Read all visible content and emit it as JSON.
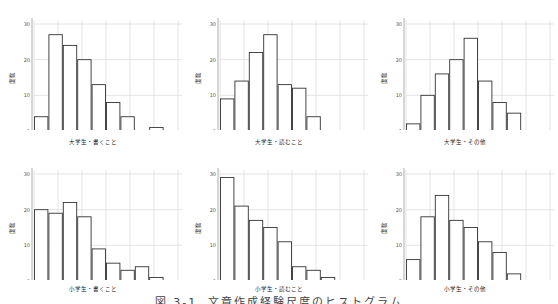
{
  "caption": "図 3-1. 文章作成経験尺度のヒストグラム",
  "chart_data": [
    {
      "type": "bar",
      "title": "",
      "xlabel": "大学生・書くこと",
      "ylabel": "度数",
      "ylim": [
        0,
        30
      ],
      "xlim": [
        1.0,
        4.0
      ],
      "xticks": [
        "1.0",
        "1.5",
        "2.0",
        "2.5",
        "3.0",
        "3.5",
        "4.0"
      ],
      "yticks": [
        "0",
        "10",
        "20",
        "30"
      ],
      "grid": true,
      "bin_width": 0.3,
      "bin_start": 1.0,
      "values": [
        4,
        27,
        24,
        20,
        13,
        8,
        4,
        0,
        1
      ]
    },
    {
      "type": "bar",
      "title": "",
      "xlabel": "大学生・読むこと",
      "ylabel": "度数",
      "ylim": [
        0,
        30
      ],
      "xlim": [
        1.0,
        4.0
      ],
      "xticks": [
        "1.0",
        "1.5",
        "2.0",
        "2.5",
        "3.0",
        "3.5",
        "4.0"
      ],
      "yticks": [
        "0",
        "10",
        "20",
        "30"
      ],
      "grid": true,
      "bin_width": 0.3,
      "bin_start": 1.0,
      "values": [
        9,
        14,
        22,
        27,
        13,
        12,
        4
      ]
    },
    {
      "type": "bar",
      "title": "",
      "xlabel": "大学生・その他",
      "ylabel": "度数",
      "ylim": [
        0,
        30
      ],
      "xlim": [
        1.0,
        4.0
      ],
      "xticks": [
        "1.0",
        "1.5",
        "2.0",
        "2.5",
        "3.0",
        "3.5",
        "4.0"
      ],
      "yticks": [
        "0",
        "10",
        "20",
        "30"
      ],
      "grid": true,
      "bin_width": 0.3,
      "bin_start": 1.0,
      "values": [
        2,
        10,
        16,
        20,
        26,
        14,
        8,
        5
      ]
    },
    {
      "type": "bar",
      "title": "",
      "xlabel": "小学生・書くこと",
      "ylabel": "度数",
      "ylim": [
        0,
        30
      ],
      "xlim": [
        1.0,
        4.0
      ],
      "xticks": [
        "1.0",
        "1.5",
        "2.0",
        "2.5",
        "3.0",
        "3.5",
        "4.0"
      ],
      "yticks": [
        "0",
        "10",
        "20",
        "30"
      ],
      "grid": true,
      "bin_width": 0.3,
      "bin_start": 1.0,
      "values": [
        20,
        19,
        22,
        18,
        9,
        5,
        3,
        4,
        1
      ]
    },
    {
      "type": "bar",
      "title": "",
      "xlabel": "小学生・読むこと",
      "ylabel": "度数",
      "ylim": [
        0,
        30
      ],
      "xlim": [
        1.0,
        4.0
      ],
      "xticks": [
        "1.0",
        "1.5",
        "2.0",
        "2.5",
        "3.0",
        "3.5",
        "4.0"
      ],
      "yticks": [
        "0",
        "10",
        "20",
        "30"
      ],
      "grid": true,
      "bin_width": 0.3,
      "bin_start": 1.0,
      "values": [
        29,
        21,
        17,
        15,
        11,
        4,
        3,
        1
      ]
    },
    {
      "type": "bar",
      "title": "",
      "xlabel": "小学生・その他",
      "ylabel": "度数",
      "ylim": [
        0,
        30
      ],
      "xlim": [
        1.0,
        4.0
      ],
      "xticks": [
        "1.0",
        "1.5",
        "2.0",
        "2.5",
        "3.0",
        "3.5",
        "4.0"
      ],
      "yticks": [
        "0",
        "10",
        "20",
        "30"
      ],
      "grid": true,
      "bin_width": 0.3,
      "bin_start": 1.0,
      "values": [
        6,
        18,
        24,
        17,
        15,
        11,
        8,
        2
      ]
    }
  ],
  "style": {
    "bar_fill": "#ffffff",
    "bar_stroke": "#333333",
    "grid_color": "#dddddd",
    "axis_color": "#999999",
    "tick_text_color": "#555555"
  }
}
